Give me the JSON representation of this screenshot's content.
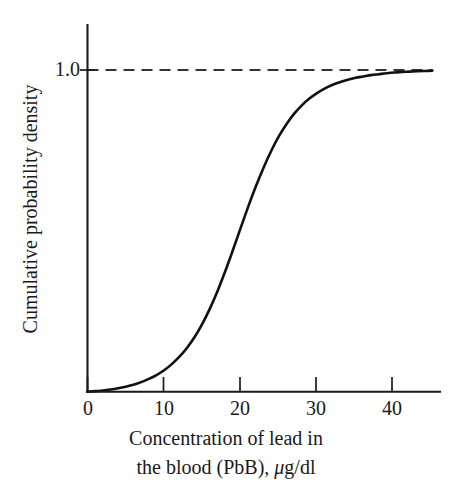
{
  "figure": {
    "background_color": "#ffffff",
    "ink_color": "#1a1a1a"
  },
  "axes": {
    "y_tick_labels": [
      "1.0"
    ],
    "x_tick_labels": [
      "0",
      "10",
      "20",
      "30",
      "40"
    ],
    "x_axis_label_line1": "Concentration of lead in",
    "x_axis_label_line2_prefix": "the blood (PbB), ",
    "x_axis_label_mu": "μ",
    "x_axis_label_line2_suffix": "g/dl",
    "y_axis_label": "Cumulative probability density"
  },
  "chart_data": {
    "type": "line",
    "title": "",
    "subtitle": "",
    "xlabel": "Concentration of lead in the blood (PbB), μg/dl",
    "ylabel": "Cumulative probability density",
    "xlim": [
      0,
      46
    ],
    "ylim": [
      0,
      1.08
    ],
    "xticks": [
      0,
      10,
      20,
      30,
      40
    ],
    "yticks": [
      1.0
    ],
    "grid": false,
    "legend": null,
    "annotations": [
      {
        "kind": "asymptote",
        "style": "dashed",
        "y": 1.0,
        "x_start": 0,
        "x_end": 45,
        "label": "1.0"
      }
    ],
    "series": [
      {
        "name": "Cumulative probability density of PbB",
        "style": "solid",
        "color": "#111111",
        "x": [
          0,
          1,
          2,
          3,
          4,
          5,
          6,
          7,
          8,
          9,
          10,
          11,
          12,
          13,
          14,
          15,
          16,
          17,
          18,
          19,
          20,
          21,
          22,
          23,
          24,
          25,
          26,
          27,
          28,
          29,
          30,
          31,
          32,
          33,
          34,
          35,
          36,
          37,
          38,
          39,
          40,
          41,
          42,
          43,
          44,
          45
        ],
        "y": [
          0.0,
          0.002,
          0.004,
          0.007,
          0.011,
          0.016,
          0.022,
          0.03,
          0.04,
          0.052,
          0.067,
          0.086,
          0.109,
          0.137,
          0.171,
          0.212,
          0.26,
          0.315,
          0.376,
          0.442,
          0.51,
          0.577,
          0.64,
          0.698,
          0.75,
          0.795,
          0.833,
          0.865,
          0.891,
          0.912,
          0.929,
          0.943,
          0.954,
          0.963,
          0.97,
          0.976,
          0.98,
          0.984,
          0.987,
          0.99,
          0.992,
          0.994,
          0.995,
          0.996,
          0.997,
          0.998
        ]
      }
    ]
  }
}
